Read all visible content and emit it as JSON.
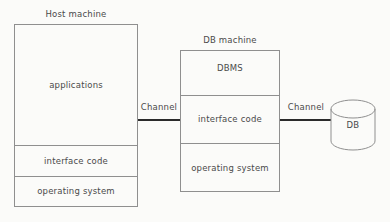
{
  "diagram": {
    "title_host": "Host machine",
    "title_db": "DB machine",
    "host_machine": {
      "layers": [
        {
          "label": "applications"
        },
        {
          "label": "interface code"
        },
        {
          "label": "operating system"
        }
      ]
    },
    "db_machine": {
      "layers": [
        {
          "label": "DBMS"
        },
        {
          "label": "interface code"
        },
        {
          "label": "operating system"
        }
      ]
    },
    "connections": [
      {
        "label": "Channel"
      },
      {
        "label": "Channel"
      }
    ],
    "database": {
      "label": "DB"
    },
    "colors": {
      "background": "#fbfbf9",
      "box_stroke": "#8f8f8f",
      "channel_stroke": "#2b2b2b",
      "text": "#4a4a4a"
    }
  }
}
